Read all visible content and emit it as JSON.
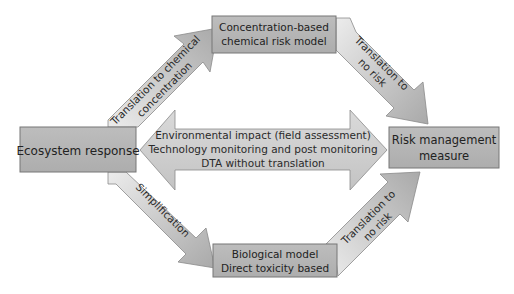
{
  "nodes": {
    "ecosystem": {
      "label": "Ecosystem response"
    },
    "concentration": {
      "line1": "Concentration-based",
      "line2": "chemical risk model"
    },
    "biological": {
      "line1": "Biological model",
      "line2": "Direct toxicity based"
    },
    "risk": {
      "line1": "Risk management",
      "line2": "measure"
    }
  },
  "edges": {
    "to_concentration": {
      "line1": "Translation to chemical",
      "line2": "concentration"
    },
    "concentration_to_risk": {
      "line1": "Translation to",
      "line2": "no risk"
    },
    "simplification": {
      "label": "Simplification"
    },
    "biological_to_risk": {
      "line1": "Translation to",
      "line2": "no risk"
    },
    "direct": {
      "line1": "Environmental impact (field assessment)",
      "line2": "Technology monitoring and post monitoring",
      "line3": "DTA without translation"
    }
  },
  "colors": {
    "box_fill": "#b5b5b5",
    "box_stroke": "#7a7a7a",
    "arrow_light": "#e6e6e6",
    "arrow_dark": "#b0b0b0",
    "arrow_stroke": "#8a8a8a"
  }
}
